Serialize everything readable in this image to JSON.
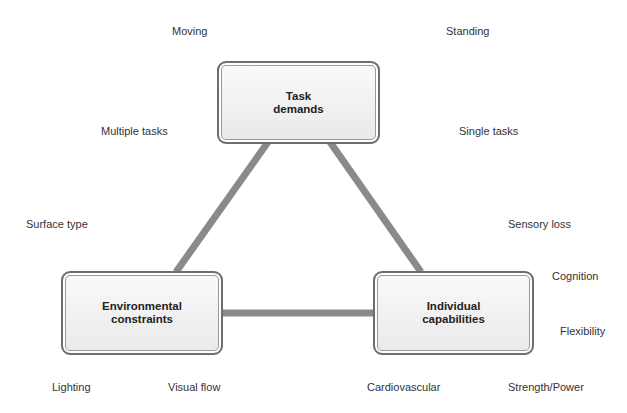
{
  "diagram": {
    "line_color": "#8a8a8a",
    "nodes": {
      "task": "Task\ndemands",
      "environment": "Environmental\nconstraints",
      "individual": "Individual\ncapabilities"
    },
    "labels": {
      "moving": "Moving",
      "standing": "Standing",
      "multiple_tasks": "Multiple tasks",
      "single_tasks": "Single tasks",
      "surface_type": "Surface type",
      "sensory_loss": "Sensory loss",
      "cognition": "Cognition",
      "flexibility": "Flexibility",
      "lighting": "Lighting",
      "visual_flow": "Visual flow",
      "cardiovascular": "Cardiovascular",
      "strength_power": "Strength/Power"
    }
  }
}
